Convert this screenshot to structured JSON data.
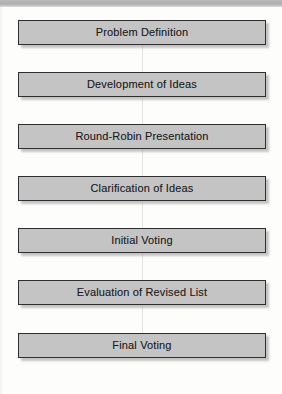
{
  "diagram": {
    "type": "flowchart",
    "orientation": "vertical",
    "title": "",
    "colors": {
      "node_fill": "#c4c4c4",
      "node_border": "#2e2e2e",
      "node_text": "#1d1d1d",
      "connector": "#e2e2e0",
      "background": "#fdfdfc",
      "scan_band": "#b4b4b4"
    },
    "nodes": [
      {
        "id": "step-1",
        "label": "Problem Definition"
      },
      {
        "id": "step-2",
        "label": "Development of Ideas"
      },
      {
        "id": "step-3",
        "label": "Round-Robin Presentation"
      },
      {
        "id": "step-4",
        "label": "Clarification of Ideas"
      },
      {
        "id": "step-5",
        "label": "Initial Voting"
      },
      {
        "id": "step-6",
        "label": "Evaluation of Revised List"
      },
      {
        "id": "step-7",
        "label": "Final Voting"
      }
    ],
    "edges": [
      {
        "from": "step-1",
        "to": "step-2"
      },
      {
        "from": "step-2",
        "to": "step-3"
      },
      {
        "from": "step-3",
        "to": "step-4"
      },
      {
        "from": "step-4",
        "to": "step-5"
      },
      {
        "from": "step-5",
        "to": "step-6"
      },
      {
        "from": "step-6",
        "to": "step-7"
      }
    ]
  }
}
